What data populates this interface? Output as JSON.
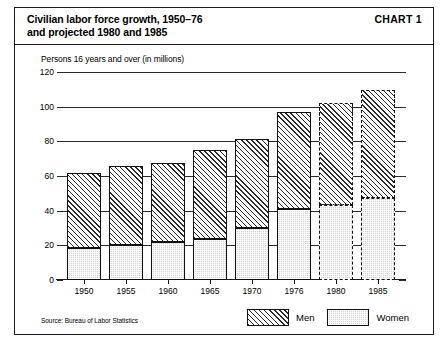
{
  "header": {
    "title": "Civilian labor force growth, 1950–76\nand projected 1980 and 1985",
    "chart_number": "CHART 1"
  },
  "axis_note": "Persons 16 years and over (in millions)",
  "source_note": "Source: Bureau of Labor Statistics",
  "legend": {
    "items": [
      {
        "label": "Men",
        "pattern": "diagonal-hatch"
      },
      {
        "label": "Women",
        "pattern": "stipple-gray"
      }
    ]
  },
  "chart_data": {
    "type": "bar",
    "subtype": "stacked",
    "xlabel": "",
    "ylabel": "Persons 16 years and over (in millions)",
    "ylim": [
      0,
      120
    ],
    "yticks": [
      0,
      20,
      40,
      60,
      80,
      100,
      120
    ],
    "ytick_labels": [
      "0",
      "20",
      "40",
      "60",
      "80",
      "100",
      "120"
    ],
    "grid": true,
    "grid_axis": "y",
    "legend_position": "bottom-right",
    "categories": [
      "1950",
      "1955",
      "1960",
      "1965",
      "1970",
      "1976",
      "1980",
      "1985"
    ],
    "projected": [
      false,
      false,
      false,
      false,
      false,
      false,
      true,
      true
    ],
    "series": [
      {
        "name": "Women",
        "values": [
          18.5,
          20.2,
          22.0,
          23.8,
          30.0,
          41.0,
          43.0,
          47.5
        ]
      },
      {
        "name": "Men",
        "values": [
          43.5,
          45.8,
          45.5,
          51.2,
          51.5,
          56.0,
          59.0,
          62.0
        ]
      }
    ],
    "totals": [
      62.0,
      66.0,
      67.5,
      75.0,
      81.5,
      97.0,
      102.0,
      109.5
    ]
  }
}
